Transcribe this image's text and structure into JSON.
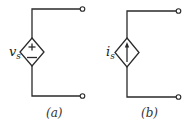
{
  "figure": {
    "panels": [
      {
        "id": "a",
        "caption": "(a)",
        "element": "dependent voltage source",
        "symbol": "diamond",
        "label_main": "v",
        "label_sub": "s",
        "plus_sign": "+",
        "minus_sign": "−"
      },
      {
        "id": "b",
        "caption": "(b)",
        "element": "dependent current source",
        "symbol": "diamond",
        "label_main": "i",
        "label_sub": "s",
        "arrow_direction": "up"
      }
    ]
  },
  "colors": {
    "line": "#2a2a2a",
    "background": "#ffffff"
  }
}
